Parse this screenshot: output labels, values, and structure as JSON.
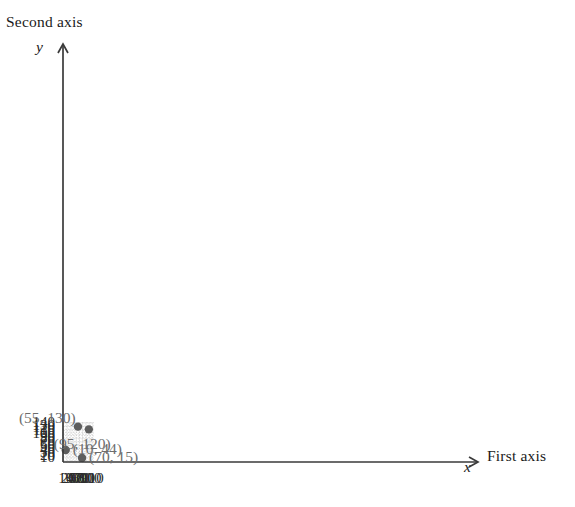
{
  "axis_titles": {
    "y_title": "Second axis",
    "x_title": "First axis",
    "y_var": "y",
    "x_var": "x"
  },
  "ticks": {
    "y": [
      "140",
      "130",
      "120",
      "110",
      "100",
      "90",
      "80",
      "70",
      "60",
      "50",
      "40",
      "30",
      "20",
      "10"
    ],
    "x": [
      "10",
      "20",
      "30",
      "40",
      "50",
      "60",
      "70",
      "80",
      "90",
      "100",
      "110"
    ]
  },
  "point_labels": {
    "p1": "(55, 130)",
    "p2": "(95, 120)",
    "p3": "(10, 44)",
    "p4": "(70, 15)"
  },
  "colors": {
    "marker": "#5d5d5d",
    "grid": "#c8c8c8",
    "axis": "#3a3a3a",
    "label_text": "#6d6d6d",
    "tick_text": "#2b2b2b"
  },
  "chart_data": {
    "type": "scatter",
    "title": "",
    "subtitle": "",
    "xlabel": "First axis",
    "ylabel": "Second axis",
    "x_var": "x",
    "y_var": "y",
    "xlim": [
      0,
      115
    ],
    "ylim": [
      0,
      147
    ],
    "xticks": [
      10,
      20,
      30,
      40,
      50,
      60,
      70,
      80,
      90,
      100,
      110
    ],
    "yticks": [
      10,
      20,
      30,
      40,
      50,
      60,
      70,
      80,
      90,
      100,
      110,
      120,
      130,
      140
    ],
    "grid": true,
    "grid_style": "dotted",
    "minor_grid": true,
    "minor_grid_step": 5,
    "legend": false,
    "points": [
      {
        "x": 55,
        "y": 130,
        "label": "(55, 130)",
        "label_position": "left"
      },
      {
        "x": 95,
        "y": 120,
        "label": "(95, 120)",
        "label_position": "below-left"
      },
      {
        "x": 10,
        "y": 44,
        "label": "(10, 44)",
        "label_position": "right"
      },
      {
        "x": 70,
        "y": 15,
        "label": "(70, 15)",
        "label_position": "right"
      }
    ]
  }
}
